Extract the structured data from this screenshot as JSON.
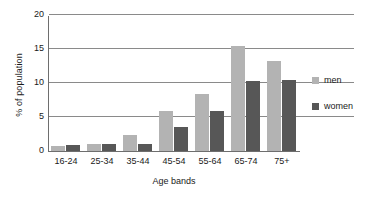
{
  "chart_data": {
    "type": "bar",
    "title": "",
    "xlabel": "Age bands",
    "ylabel": "% of population",
    "categories": [
      "16-24",
      "25-34",
      "35-44",
      "45-54",
      "55-64",
      "65-74",
      "75+"
    ],
    "series": [
      {
        "name": "men",
        "color": "#b3b3b3",
        "values": [
          0.7,
          1.1,
          2.3,
          5.9,
          8.4,
          15.5,
          13.3
        ]
      },
      {
        "name": "women",
        "color": "#575757",
        "values": [
          0.9,
          1.1,
          1.1,
          3.5,
          5.9,
          10.3,
          10.5
        ]
      }
    ],
    "ylim": [
      0,
      20
    ],
    "yticks": [
      0,
      5,
      10,
      15,
      20
    ],
    "ytick_labels": [
      "0",
      "5",
      "10",
      "15",
      "20"
    ],
    "grid": "horizontal",
    "legend_position": "right",
    "legend": [
      "men",
      "women"
    ]
  },
  "axis": {
    "y_title": "% of population",
    "x_title": "Age bands"
  },
  "legend": {
    "items": [
      {
        "label": "men"
      },
      {
        "label": "women"
      }
    ]
  }
}
